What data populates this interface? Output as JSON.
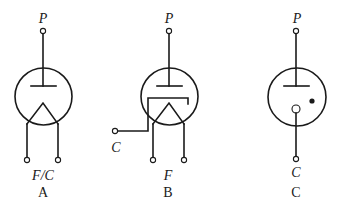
{
  "figure": {
    "type": "vacuum-tube-schematic-symbols",
    "tubes": [
      {
        "id": "A",
        "caption": "A",
        "description": "Diode, directly heated (filament serves as cathode)",
        "terminals": {
          "top": "P",
          "bottom": "F/C"
        }
      },
      {
        "id": "B",
        "caption": "B",
        "description": "Diode, indirectly heated (separate cathode sleeve)",
        "terminals": {
          "top": "P",
          "side": "C",
          "bottom": "F"
        }
      },
      {
        "id": "C",
        "caption": "C",
        "description": "Gas-filled diode (cold cathode, dot indicates gas)",
        "terminals": {
          "top": "P",
          "bottom": "C"
        }
      }
    ]
  },
  "colors": {
    "line": "#1a1a1a",
    "background": "#ffffff"
  }
}
